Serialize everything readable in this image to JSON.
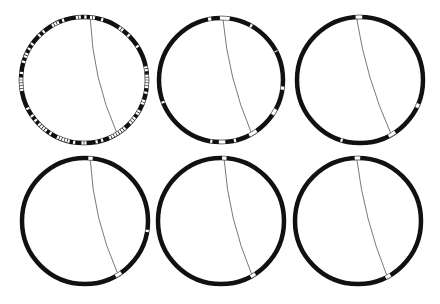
{
  "figure": {
    "width": 440,
    "height": 304,
    "background": "#ffffff",
    "ring_color": "#111111",
    "gap_color": "#ffffff",
    "gap_stroke": "#9a9a9a",
    "chord_color": "#555555",
    "ring_width": 4.5,
    "panels": [
      {
        "id": "panel-1",
        "cx": 84,
        "cy": 80,
        "r": 63,
        "chord": {
          "start_deg": 6,
          "end_deg": 148
        },
        "pattern": "dense",
        "segments_seed": 7,
        "segment_count": 140
      },
      {
        "id": "panel-2",
        "cx": 221,
        "cy": 80,
        "r": 62,
        "chord": {
          "start_deg": 2,
          "end_deg": 150
        },
        "pattern": "sparse",
        "gaps": [
          [
            -12,
            -9
          ],
          [
            -1,
            8
          ],
          [
            28,
            30
          ],
          [
            62,
            63
          ],
          [
            96,
            99
          ],
          [
            118,
            124
          ],
          [
            145,
            153
          ],
          [
            166,
            168
          ],
          [
            176,
            182
          ],
          [
            188,
            190
          ],
          [
            248,
            250
          ]
        ]
      },
      {
        "id": "panel-3",
        "cx": 360,
        "cy": 80,
        "r": 63,
        "chord": {
          "start_deg": -3,
          "end_deg": 150
        },
        "pattern": "sparse",
        "gaps": [
          [
            -4,
            2
          ],
          [
            112,
            116
          ],
          [
            146,
            153
          ],
          [
            196,
            198
          ]
        ]
      },
      {
        "id": "panel-4",
        "cx": 85,
        "cy": 221,
        "r": 63,
        "chord": {
          "start_deg": 5,
          "end_deg": 148
        },
        "pattern": "sparse",
        "gaps": [
          [
            3,
            7
          ],
          [
            98,
            100
          ],
          [
            145,
            151
          ]
        ]
      },
      {
        "id": "panel-5",
        "cx": 221,
        "cy": 221,
        "r": 63,
        "chord": {
          "start_deg": 3,
          "end_deg": 150
        },
        "pattern": "sparse",
        "gaps": [
          [
            1,
            5
          ],
          [
            147,
            152
          ]
        ]
      },
      {
        "id": "panel-6",
        "cx": 358,
        "cy": 221,
        "r": 63,
        "chord": {
          "start_deg": -1,
          "end_deg": 152
        },
        "pattern": "sparse",
        "gaps": [
          [
            -3,
            2
          ],
          [
            149,
            154
          ]
        ]
      }
    ]
  }
}
